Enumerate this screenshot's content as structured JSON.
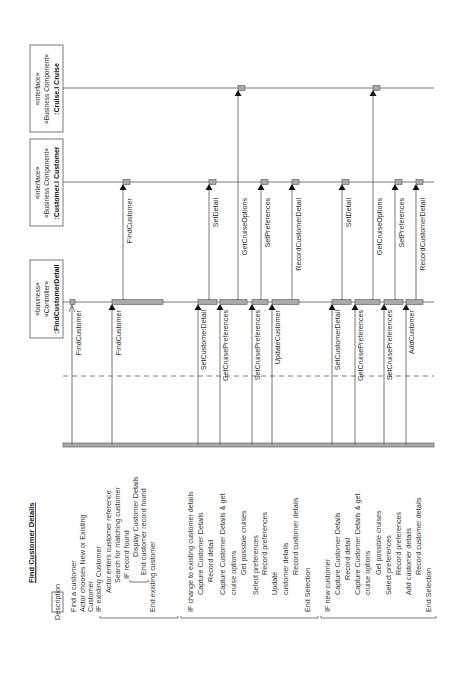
{
  "title": "Find Customer Details",
  "description_label": "Description",
  "participants": [
    {
      "stereotype1": "«business»",
      "stereotype2": "«Controller»",
      "name": ":FindCustomerDetail"
    },
    {
      "stereotype1": "«interface»",
      "stereotype2": "«Business Component»",
      "name": ":Customer.I Customer"
    },
    {
      "stereotype1": "«interface»",
      "stereotype2": "«Business Component»",
      "name": ":Cruise.I Cruise"
    }
  ],
  "messages": [
    {
      "label": "FindCustomer",
      "from": "Actor",
      "to": ":FindCustomerDetail",
      "arrow": "open"
    },
    {
      "label": "FindCustomer",
      "from": "Actor",
      "to": ":FindCustomerDetail",
      "arrow": "filled"
    },
    {
      "label": "FindCustomer",
      "from": ":FindCustomerDetail",
      "to": ":Customer.I Customer",
      "arrow": "filled"
    },
    {
      "label": "SetCustomerDetail",
      "from": "Actor",
      "to": ":FindCustomerDetail",
      "arrow": "filled"
    },
    {
      "label": "SetDetail",
      "from": ":FindCustomerDetail",
      "to": ":Customer.I Customer",
      "arrow": "filled"
    },
    {
      "label": "GetCruisePreferences",
      "from": "Actor",
      "to": ":FindCustomerDetail",
      "arrow": "filled"
    },
    {
      "label": "GetCruiseOptions",
      "from": ":FindCustomerDetail",
      "to": ":Cruise.I Cruise",
      "arrow": "filled"
    },
    {
      "label": "SetCruisePreferences",
      "from": "Actor",
      "to": ":FindCustomerDetail",
      "arrow": "filled"
    },
    {
      "label": "SetPreferences",
      "from": ":FindCustomerDetail",
      "to": ":Customer.I Customer",
      "arrow": "filled"
    },
    {
      "label": "UpdateCustomer",
      "from": "Actor",
      "to": ":FindCustomerDetail",
      "arrow": "filled"
    },
    {
      "label": "RecordCustomerDetail",
      "from": ":FindCustomerDetail",
      "to": ":Customer.I Customer",
      "arrow": "filled"
    },
    {
      "label": "SetCustomerDetail",
      "from": "Actor",
      "to": ":FindCustomerDetail",
      "arrow": "filled"
    },
    {
      "label": "SetDetail",
      "from": ":FindCustomerDetail",
      "to": ":Customer.I Customer",
      "arrow": "filled"
    },
    {
      "label": "GetCruisePreferences",
      "from": "Actor",
      "to": ":FindCustomerDetail",
      "arrow": "filled"
    },
    {
      "label": "GetCruiseOptions",
      "from": ":FindCustomerDetail",
      "to": ":Cruise.I Cruise",
      "arrow": "filled"
    },
    {
      "label": "SetCruisePreferences",
      "from": "Actor",
      "to": ":FindCustomerDetail",
      "arrow": "filled"
    },
    {
      "label": "SetPreferences",
      "from": ":FindCustomerDetail",
      "to": ":Customer.I Customer",
      "arrow": "filled"
    },
    {
      "label": "AddCustomer",
      "from": "Actor",
      "to": ":FindCustomerDetail",
      "arrow": "filled"
    },
    {
      "label": "RecordCustomerDetail",
      "from": ":FindCustomerDetail",
      "to": ":Customer.I Customer",
      "arrow": "filled"
    }
  ],
  "description_groups": [
    {
      "lines": [
        "Find a customer",
        "Actor chooses New or Existing",
        "Customer",
        "IF existing Customer",
        "Actor enters customer reference",
        "Search for matching customer",
        "IF record found",
        "Display Customer Details",
        "End customer record found",
        "End existing customer"
      ]
    },
    {
      "lines": [
        "IF change to existing customer details",
        "Capture Customer Details",
        "Record detail",
        "Capture Customer Details & get",
        "cruise options",
        "Get possible cruises",
        "Select preferences",
        "Record preferences",
        "Update",
        "customer details",
        "Record customer details",
        "End Selection"
      ]
    },
    {
      "lines": [
        "IF new customer",
        "Capture Customer Details",
        "Record detail",
        "Capture Customer Details & get",
        "cruise options",
        "Get possible cruises",
        "Select preferences",
        "Record preferences",
        "Add customer details",
        "Record customer details",
        "End Selection"
      ]
    }
  ]
}
